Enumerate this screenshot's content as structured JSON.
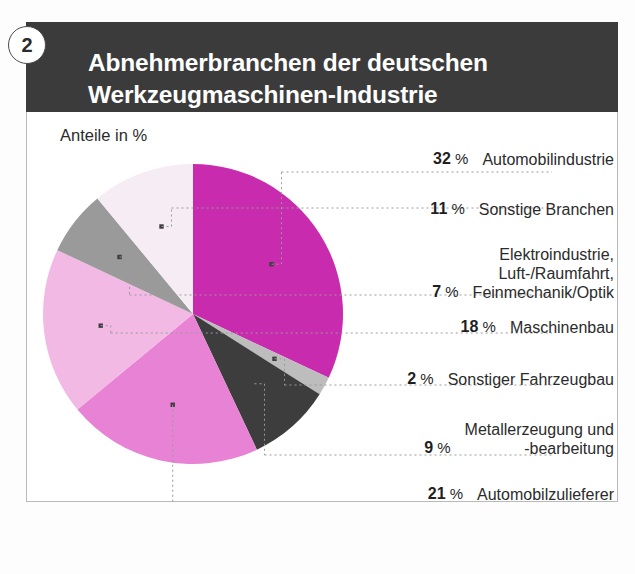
{
  "badge": {
    "number": "2"
  },
  "header": {
    "title_line1": "Abnehmerbranchen der deutschen",
    "title_line2": "Werkzeugmaschinen-Industrie"
  },
  "chart_subtitle": "Anteile in %",
  "colors": {
    "title_bar": "#3b3b3b",
    "magenta": "#c92bae",
    "light_gray": "#bdbdbd",
    "dark_gray": "#3d3d3d",
    "pink_medium": "#e882d4",
    "pink_light": "#f2b9e4",
    "gray_mid": "#9a9a9a",
    "pale_pink": "#f6ecf3",
    "frame": "#b9b9b9",
    "leader": "#9a9a9a"
  },
  "chart_data": {
    "type": "pie",
    "title": "Abnehmerbranchen der deutschen Werkzeugmaschinen-Industrie",
    "subtitle": "Anteile in %",
    "unit": "%",
    "legend_position": "right",
    "grid": false,
    "categories": [
      "Automobilindustrie",
      "Sonstiger Fahrzeugbau",
      "Metallerzeugung und -bearbeitung",
      "Automobilzulieferer",
      "Maschinenbau",
      "Elektroindustrie, Luft-/Raumfahrt, Feinmechanik/Optik",
      "Sonstige Branchen"
    ],
    "values": [
      32,
      2,
      9,
      21,
      18,
      7,
      11
    ],
    "slices": [
      {
        "label": "Automobilindustrie",
        "value": 32,
        "pct_text": "32",
        "color": "#c92bae"
      },
      {
        "label": "Sonstiger Fahrzeugbau",
        "value": 2,
        "pct_text": "2",
        "color": "#bdbdbd"
      },
      {
        "label": "Metallerzeugung und -bearbeitung",
        "value": 9,
        "pct_text": "9",
        "color": "#3d3d3d"
      },
      {
        "label": "Automobilzulieferer",
        "value": 21,
        "pct_text": "21",
        "color": "#e882d4"
      },
      {
        "label": "Maschinenbau",
        "value": 18,
        "pct_text": "18",
        "color": "#f2b9e4"
      },
      {
        "label": "Elektroindustrie, Luft-/Raumfahrt, Feinmechanik/Optik",
        "value": 7,
        "pct_text": "7",
        "color": "#9a9a9a"
      },
      {
        "label": "Sonstige Branchen",
        "value": 11,
        "pct_text": "11",
        "color": "#f6ecf3"
      }
    ]
  },
  "legend": {
    "percent_symbol": "%",
    "rows": [
      {
        "pct": "32",
        "label": "Automobilindustrie"
      },
      {
        "pct": "11",
        "label": "Sonstige Branchen"
      },
      {
        "pct": "7",
        "label": "Elektroindustrie,\nLuft-/Raumfahrt,\nFeinmechanik/Optik"
      },
      {
        "pct": "18",
        "label": "Maschinenbau"
      },
      {
        "pct": "2",
        "label": "Sonstiger Fahrzeugbau"
      },
      {
        "pct": "9",
        "label": "Metallerzeugung und\n-bearbeitung"
      },
      {
        "pct": "21",
        "label": "Automobilzulieferer"
      }
    ]
  }
}
